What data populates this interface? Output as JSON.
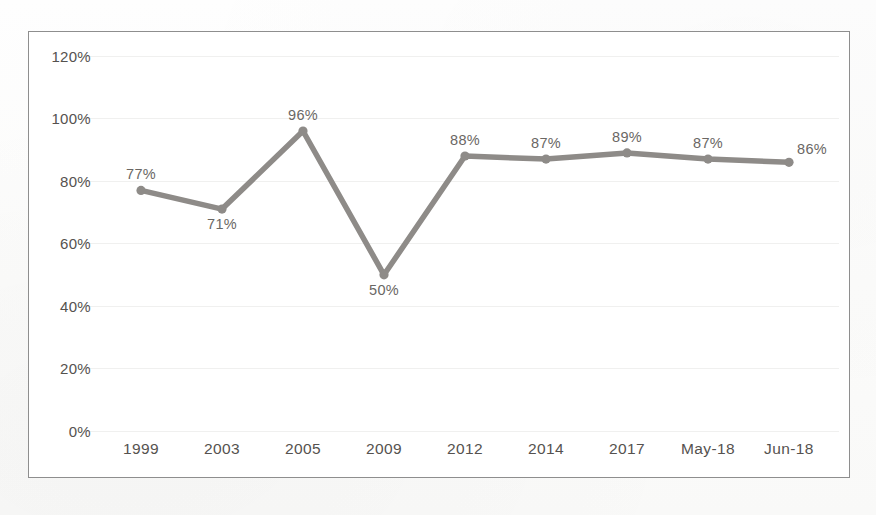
{
  "chart_data": {
    "type": "line",
    "title": "",
    "subtitle": "",
    "xlabel": "",
    "ylabel": "",
    "categories": [
      "1999",
      "2003",
      "2005",
      "2009",
      "2012",
      "2014",
      "2017",
      "May-18",
      "Jun-18"
    ],
    "values": [
      77,
      71,
      96,
      50,
      88,
      87,
      89,
      87,
      86
    ],
    "point_labels": [
      "77%",
      "71%",
      "96%",
      "50%",
      "88%",
      "87%",
      "89%",
      "87%",
      "86%"
    ],
    "label_positions": [
      "above",
      "below",
      "above",
      "below",
      "above",
      "above",
      "above",
      "above",
      "right"
    ],
    "ylim": [
      0,
      120
    ],
    "ytick_values": [
      0,
      20,
      40,
      60,
      80,
      100,
      120
    ],
    "ytick_labels": [
      "0%",
      "20%",
      "40%",
      "60%",
      "80%",
      "100%",
      "120%"
    ],
    "grid": true,
    "legend": "none",
    "series_color": "#8e8b88",
    "marker_color": "#8e8b88",
    "gridline_color": "#f0f0ef",
    "axis_text_color": "#55524f",
    "label_text_color": "#6a6764",
    "frame_border_color": "#8e8e8e",
    "plot_background": "#ffffff"
  }
}
